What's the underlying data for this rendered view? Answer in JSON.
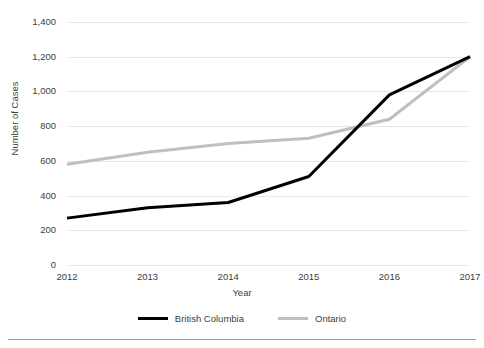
{
  "chart_data": {
    "type": "line",
    "title": "",
    "xlabel": "Year",
    "ylabel": "Number of Cases",
    "categories": [
      "2012",
      "2013",
      "2014",
      "2015",
      "2016",
      "2017"
    ],
    "x": [
      2012,
      2013,
      2014,
      2015,
      2016,
      2017
    ],
    "xlim": [
      2012,
      2017
    ],
    "ylim": [
      0,
      1400
    ],
    "yticks": [
      0,
      200,
      400,
      600,
      800,
      1000,
      1200,
      1400
    ],
    "ytick_labels": [
      "0",
      "200",
      "400",
      "600",
      "800",
      "1,000",
      "1,200",
      "1,400"
    ],
    "grid": "horizontal",
    "legend_position": "bottom",
    "series": [
      {
        "name": "British Columbia",
        "color": "#000000",
        "linewidth": 3,
        "values": [
          270,
          330,
          360,
          510,
          980,
          1200
        ]
      },
      {
        "name": "Ontario",
        "color": "#bfbfbf",
        "linewidth": 3,
        "values": [
          580,
          650,
          700,
          730,
          840,
          1200
        ]
      }
    ]
  },
  "legend": {
    "items": [
      {
        "label": "British Columbia",
        "color": "#000000"
      },
      {
        "label": "Ontario",
        "color": "#bfbfbf"
      }
    ]
  },
  "colors": {
    "gridline": "#e8e8e8",
    "text": "#404040",
    "background": "#ffffff",
    "rule": "#9a9a9a"
  }
}
